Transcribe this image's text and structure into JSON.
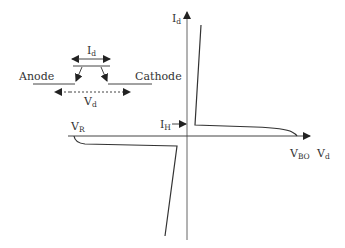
{
  "diagram": {
    "type": "I-V characteristic",
    "device_symbol": {
      "anode_label": "Anode",
      "cathode_label": "Cathode",
      "current_label": "I",
      "current_sub": "d",
      "voltage_label": "V",
      "voltage_sub": "d"
    },
    "axes": {
      "y_label": "I",
      "y_sub": "d",
      "x_label": "V",
      "x_sub": "d"
    },
    "annotations": {
      "vr_label": "V",
      "vr_sub": "R",
      "ih_label": "I",
      "ih_sub": "H",
      "vbo_label": "V",
      "vbo_sub": "BO"
    },
    "colors": {
      "curve": "#333333",
      "axis": "#555555",
      "text": "#333333"
    }
  }
}
